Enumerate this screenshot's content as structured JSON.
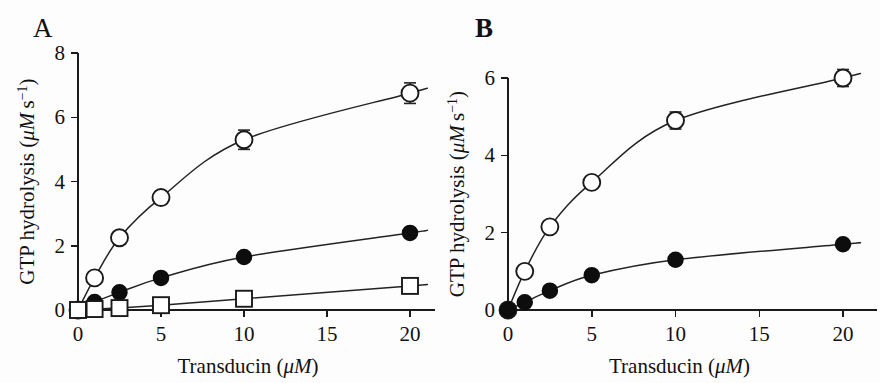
{
  "figure": {
    "background": "#fdfdfd",
    "ink_color": "#1a1a1a",
    "panels": [
      {
        "letter": "A",
        "xlabel_main": "Transducin (",
        "xlabel_unit": "μM",
        "xlabel_close": ")",
        "ylabel_main": "GTP hydrolysis (",
        "ylabel_unit": "μM",
        "ylabel_unit2": " s",
        "ylabel_sup": "−1",
        "ylabel_close": ")"
      },
      {
        "letter": "B",
        "xlabel_main": "Transducin (",
        "xlabel_unit": "μM",
        "xlabel_close": ")",
        "ylabel_main": "GTP hydrolysis (",
        "ylabel_unit": "μM",
        "ylabel_unit2": " s",
        "ylabel_sup": "−1",
        "ylabel_close": ")"
      }
    ]
  },
  "chart_data": [
    {
      "panel": "A",
      "type": "scatter",
      "title": "A",
      "xlabel": "Transducin (μM)",
      "ylabel": "GTP hydrolysis (μM s⁻¹)",
      "xlim": [
        0,
        21.5
      ],
      "ylim": [
        0,
        8
      ],
      "xticks": [
        0,
        5,
        10,
        15,
        20
      ],
      "xticklabels": [
        "0",
        "5",
        "10",
        "15",
        "20"
      ],
      "yticks": [
        0,
        2,
        4,
        6,
        8
      ],
      "yticklabels": [
        "0",
        "2",
        "4",
        "6",
        "8"
      ],
      "grid": false,
      "legend": null,
      "series": [
        {
          "name": "open-circle",
          "marker": "open-circle",
          "x": [
            0,
            1,
            2.5,
            5,
            10,
            20
          ],
          "y": [
            0,
            1.0,
            2.25,
            3.5,
            5.3,
            6.75
          ],
          "yerr": [
            0,
            0.12,
            0.18,
            0.2,
            0.3,
            0.32
          ]
        },
        {
          "name": "filled-circle",
          "marker": "filled-circle",
          "x": [
            0,
            1,
            2.5,
            5,
            10,
            20
          ],
          "y": [
            0,
            0.25,
            0.55,
            1.0,
            1.65,
            2.4
          ],
          "yerr": [
            0,
            0,
            0,
            0,
            0,
            0
          ]
        },
        {
          "name": "open-square",
          "marker": "open-square",
          "x": [
            0,
            1,
            2.5,
            5,
            10,
            20
          ],
          "y": [
            0,
            0.03,
            0.06,
            0.15,
            0.35,
            0.75
          ],
          "yerr": [
            0,
            0,
            0,
            0,
            0,
            0
          ]
        }
      ]
    },
    {
      "panel": "B",
      "type": "scatter",
      "title": "B",
      "xlabel": "Transducin (μM)",
      "ylabel": "GTP hydrolysis (μM s⁻¹)",
      "xlim": [
        0,
        21.5
      ],
      "ylim": [
        0,
        6.6
      ],
      "xticks": [
        0,
        5,
        10,
        15,
        20
      ],
      "xticklabels": [
        "0",
        "5",
        "10",
        "15",
        "20"
      ],
      "yticks": [
        0,
        2,
        4,
        6
      ],
      "yticklabels": [
        "0",
        "2",
        "4",
        "6"
      ],
      "grid": false,
      "legend": null,
      "series": [
        {
          "name": "open-circle",
          "marker": "open-circle",
          "x": [
            0,
            1,
            2.5,
            5,
            10,
            20
          ],
          "y": [
            0,
            1.0,
            2.15,
            3.3,
            4.9,
            6.0
          ],
          "yerr": [
            0,
            0,
            0.12,
            0.13,
            0.22,
            0.22
          ]
        },
        {
          "name": "filled-circle",
          "marker": "filled-circle",
          "x": [
            0,
            1,
            2.5,
            5,
            10,
            20
          ],
          "y": [
            0,
            0.2,
            0.5,
            0.9,
            1.3,
            1.7
          ],
          "yerr": [
            0,
            0,
            0,
            0,
            0,
            0
          ]
        }
      ]
    }
  ]
}
